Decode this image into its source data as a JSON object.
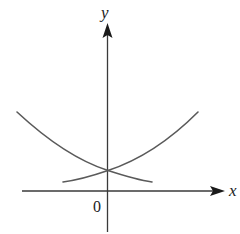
{
  "diagram": {
    "type": "function-graph",
    "axes": {
      "x_label": "x",
      "y_label": "y",
      "origin_label": "0"
    },
    "curves": [
      {
        "name": "decreasing-curve",
        "shape": "decreasing convex (like a^x, 0<a<1)"
      },
      {
        "name": "increasing-curve",
        "shape": "increasing convex (like a^x, a>1)"
      }
    ],
    "intersection": "on positive y-axis"
  }
}
